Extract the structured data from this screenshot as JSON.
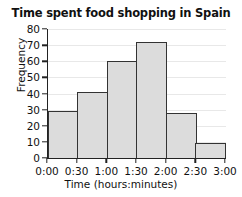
{
  "chart_data": {
    "type": "bar",
    "title": "Time spent food shopping in Spain",
    "xlabel": "Time (hours:minutes)",
    "ylabel": "Frequency",
    "categories": [
      "0:00-0:30",
      "0:30-1:00",
      "1:00-1:30",
      "1:30-2:00",
      "2:00-2:30",
      "2:30-3:00"
    ],
    "values": [
      29,
      41,
      60,
      72,
      28,
      9.5
    ],
    "bin_edges": [
      "0:00",
      "0:30",
      "1:00",
      "1:30",
      "2:00",
      "2:30",
      "3:00"
    ],
    "x_tick_labels": [
      "0:00",
      "0:30",
      "1:00",
      "1:30",
      "2:00",
      "2:30",
      "3:00"
    ],
    "y_tick_labels": [
      "0",
      "10",
      "20",
      "30",
      "40",
      "50",
      "60",
      "70",
      "80"
    ],
    "y_ticks": [
      0,
      10,
      20,
      30,
      40,
      50,
      60,
      70,
      80
    ],
    "ylim": [
      0,
      80
    ],
    "grid": true,
    "legend": false,
    "bar_fill_color": "#dcdcdc",
    "bar_border_color": "#333333",
    "axis_color": "#222222",
    "grid_color": "#e8e8e8",
    "background_color": "#ffffff",
    "text_color": "#111111"
  }
}
